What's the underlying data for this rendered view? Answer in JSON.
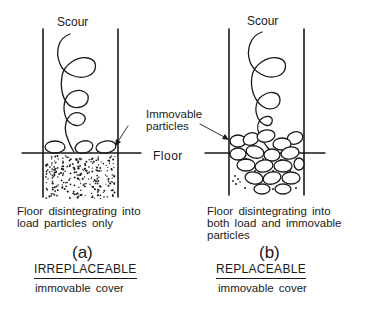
{
  "figure": {
    "panels": [
      {
        "id": "a",
        "scour_label": "Scour",
        "caption_line1": "Floor disintegrating into",
        "caption_line2": "load particles only",
        "letter": "(a)",
        "type_label": "IRREPLACEABLE",
        "cover_label": "immovable cover"
      },
      {
        "id": "b",
        "scour_label": "Scour",
        "caption_line1": "Floor disintegrating into",
        "caption_line2": "both load and immovable",
        "caption_line3": "particles",
        "letter": "(b)",
        "type_label": "REPLACEABLE",
        "cover_label": "immovable cover"
      }
    ],
    "shared_labels": {
      "immovable_line1": "Immovable",
      "immovable_line2": "particles",
      "floor": "Floor"
    },
    "colors": {
      "ink": "#1a1a1a",
      "background": "#ffffff"
    }
  }
}
